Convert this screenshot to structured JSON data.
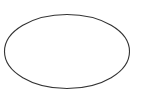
{
  "canvas": {
    "width": 144,
    "height": 100,
    "background_color": "#ffffff",
    "title": "Ellipse outline"
  },
  "shapes": [
    {
      "name": "ellipse",
      "type": "ellipse",
      "cx": 67,
      "cy": 51.5,
      "rx": 62.5,
      "ry": 37,
      "stroke_color": "#333333",
      "stroke_width": 1.1,
      "fill": "none"
    }
  ],
  "labels": []
}
